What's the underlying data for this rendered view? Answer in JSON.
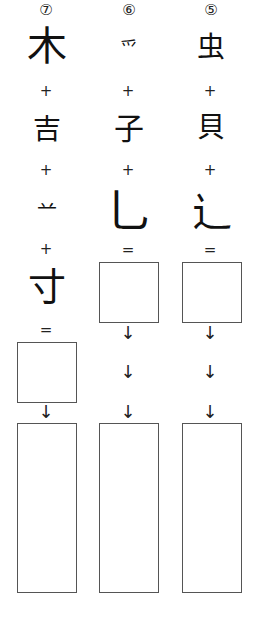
{
  "columns": [
    {
      "number": "⑦",
      "components": [
        "木",
        "吉",
        "䒑",
        "寸"
      ],
      "operators": [
        "+",
        "+",
        "+",
        "="
      ],
      "arrows": [
        "↓"
      ]
    },
    {
      "number": "⑥",
      "components": [
        "爫",
        "子",
        "乚"
      ],
      "operators": [
        "+",
        "+",
        "="
      ],
      "arrows": [
        "↓",
        "↓",
        "↓"
      ]
    },
    {
      "number": "⑤",
      "components": [
        "虫",
        "貝",
        "⻌"
      ],
      "operators": [
        "+",
        "+",
        "="
      ],
      "arrows": [
        "↓",
        "↓",
        "↓"
      ]
    }
  ]
}
